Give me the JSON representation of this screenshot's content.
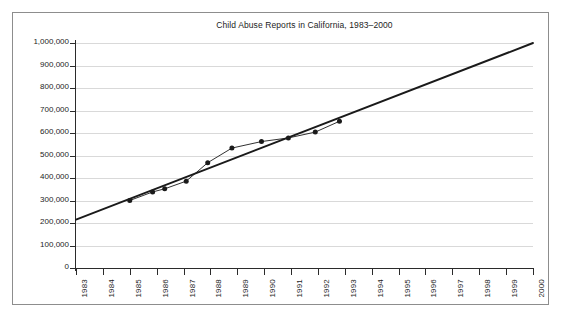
{
  "chart_data": {
    "type": "line",
    "title": "Child Abuse Reports in California, 1983–2000",
    "xlabel": "",
    "ylabel": "",
    "xlim": [
      1983,
      2000
    ],
    "ylim": [
      0,
      1000000
    ],
    "grid": true,
    "legend": "none",
    "y_ticks": [
      0,
      100000,
      200000,
      300000,
      400000,
      500000,
      600000,
      700000,
      800000,
      900000,
      1000000
    ],
    "y_tick_labels": [
      "0",
      "100,000",
      "200,000",
      "300,000",
      "400,000",
      "500,000",
      "600,000",
      "700,000",
      "800,000",
      "900,000",
      "1,000,000"
    ],
    "x_ticks": [
      1983,
      1984,
      1985,
      1986,
      1987,
      1988,
      1989,
      1990,
      1991,
      1992,
      1993,
      1994,
      1995,
      1996,
      1997,
      1998,
      1999,
      2000
    ],
    "x_tick_labels": [
      "1983",
      "1984",
      "1985",
      "1986",
      "1987",
      "1988",
      "1989",
      "1990",
      "1991",
      "1992",
      "1993",
      "1994",
      "1995",
      "1996",
      "1997",
      "1998",
      "1999",
      "2000"
    ],
    "series": [
      {
        "name": "Reported child abuse cases",
        "type": "line-markers",
        "color": "#1a1a1a",
        "marker": "circle",
        "x": [
          1985.0,
          1985.85,
          1986.3,
          1987.1,
          1987.9,
          1988.8,
          1989.9,
          1990.9,
          1991.9,
          1992.8
        ],
        "values": [
          300000,
          338000,
          352000,
          386000,
          468000,
          533000,
          562000,
          578000,
          604000,
          652000
        ]
      },
      {
        "name": "Projected trend line",
        "type": "line",
        "color": "#1a1a1a",
        "marker": "none",
        "x": [
          1983,
          2000
        ],
        "values": [
          215000,
          1000000
        ]
      }
    ]
  }
}
